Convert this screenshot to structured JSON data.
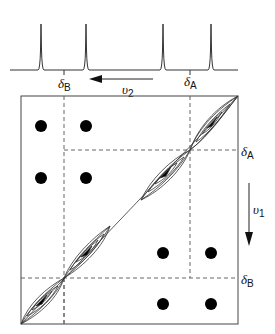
{
  "figure": {
    "type": "2D NMR COSY schematic",
    "colors": {
      "line": "#333333",
      "dash": "#555555",
      "fill": "#000000",
      "background": "#ffffff"
    },
    "spectrum_1d": {
      "peaks_x": [
        41,
        86,
        163,
        211
      ],
      "axis_arrow_label": "υ",
      "axis_arrow_subscript": "2",
      "labels": [
        {
          "symbol": "δ",
          "subscript": "B",
          "x": 64
        },
        {
          "symbol": "δ",
          "subscript": "A",
          "x": 190
        }
      ]
    },
    "spectrum_2d": {
      "box": {
        "left": 21,
        "top": 96,
        "right": 238,
        "bottom": 324
      },
      "axis_arrow_label": "υ",
      "axis_arrow_subscript": "1",
      "right_labels": [
        {
          "symbol": "δ",
          "subscript": "A",
          "y": 150
        },
        {
          "symbol": "δ",
          "subscript": "B",
          "y": 278
        }
      ],
      "cross_peaks": [
        {
          "x": 41,
          "y": 126
        },
        {
          "x": 86,
          "y": 126
        },
        {
          "x": 41,
          "y": 178
        },
        {
          "x": 86,
          "y": 178
        },
        {
          "x": 163,
          "y": 253
        },
        {
          "x": 211,
          "y": 253
        },
        {
          "x": 163,
          "y": 304
        },
        {
          "x": 211,
          "y": 304
        }
      ]
    }
  }
}
